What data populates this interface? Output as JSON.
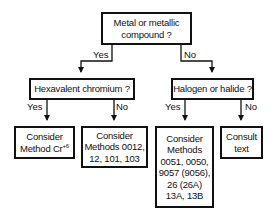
{
  "diagram": {
    "type": "decision-flowchart",
    "nodes": {
      "root": {
        "lines": [
          "Metal or metallic",
          "compound ?"
        ]
      },
      "hexavalent": {
        "lines": [
          "Hexavalent chromium ?"
        ]
      },
      "halogen": {
        "lines": [
          "Halogen or halide ?"
        ]
      },
      "cr6": {
        "line1": "Consider",
        "line2_prefix": "Method Cr",
        "line2_sup": "+6"
      },
      "methods_a": {
        "lines": [
          "Consider",
          "Methods 0012,",
          "12, 101, 103"
        ]
      },
      "methods_b": {
        "lines": [
          "Consider",
          "Methods",
          "0051, 0050,",
          "9057 (9056),",
          "26 (26A)",
          "13A, 13B"
        ]
      },
      "consult": {
        "lines": [
          "Consult",
          "text"
        ]
      }
    },
    "edges": [
      {
        "from": "root",
        "to": "hexavalent",
        "label": "Yes"
      },
      {
        "from": "root",
        "to": "halogen",
        "label": "No"
      },
      {
        "from": "hexavalent",
        "to": "cr6",
        "label": "Yes"
      },
      {
        "from": "hexavalent",
        "to": "methods_a",
        "label": "No"
      },
      {
        "from": "halogen",
        "to": "methods_b",
        "label": "Yes"
      },
      {
        "from": "halogen",
        "to": "consult",
        "label": "No"
      }
    ],
    "labels": {
      "yes": "Yes",
      "no": "No"
    }
  }
}
